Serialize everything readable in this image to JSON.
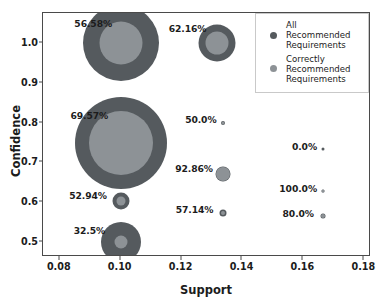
{
  "chart_data": {
    "type": "scatter",
    "title": "",
    "xlabel": "Support",
    "ylabel": "Confidence",
    "xlim": [
      0.0745,
      0.1822
    ],
    "ylim": [
      0.462,
      1.0765
    ],
    "xticks": [
      "0.08",
      "0.10",
      "0.12",
      "0.14",
      "0.16",
      "0.18"
    ],
    "xtick_values": [
      0.08,
      0.1,
      0.12,
      0.14,
      0.16,
      0.18
    ],
    "yticks": [
      "0.5",
      "0.6",
      "0.7",
      "0.8",
      "0.9",
      "1.0"
    ],
    "ytick_values": [
      0.5,
      0.6,
      0.7,
      0.8,
      0.9,
      1.0
    ],
    "grid": false,
    "legend_position": "upper right",
    "series": [
      {
        "name": "All Recommended Requirements",
        "color": "#555a5e",
        "marker": "circle"
      },
      {
        "name": "Correctly Recommended Requirements",
        "color": "#8d9296",
        "marker": "circle"
      }
    ],
    "points": [
      {
        "label": "56.58%",
        "support": 0.1,
        "confidence": 1.0,
        "all_size": 76,
        "correct_size": 43,
        "label_anchor_x": 0.0975,
        "label_anchor_y": 1.049
      },
      {
        "label": "62.16%",
        "support": 0.1315,
        "confidence": 1.0,
        "all_size": 37,
        "correct_size": 23,
        "label_anchor_x": 0.1285,
        "label_anchor_y": 1.036
      },
      {
        "label": "69.57%",
        "support": 0.1,
        "confidence": 0.75,
        "all_size": 92,
        "correct_size": 64,
        "label_anchor_x": 0.0962,
        "label_anchor_y": 0.818
      },
      {
        "label": "50.0%",
        "support": 0.1335,
        "confidence": 0.8,
        "all_size": 4,
        "correct_size": 3,
        "label_anchor_x": 0.1318,
        "label_anchor_y": 0.806
      },
      {
        "label": "0.0%",
        "support": 0.1665,
        "confidence": 0.735,
        "all_size": 3,
        "correct_size": 0,
        "label_anchor_x": 0.1648,
        "label_anchor_y": 0.739
      },
      {
        "label": "92.86%",
        "support": 0.1335,
        "confidence": 0.672,
        "all_size": 15,
        "correct_size": 14,
        "label_anchor_x": 0.1306,
        "label_anchor_y": 0.684
      },
      {
        "label": "100.0%",
        "support": 0.1665,
        "confidence": 0.628,
        "all_size": 3,
        "correct_size": 3,
        "label_anchor_x": 0.1648,
        "label_anchor_y": 0.632
      },
      {
        "label": "52.94%",
        "support": 0.1,
        "confidence": 0.602,
        "all_size": 17,
        "correct_size": 9,
        "label_anchor_x": 0.0958,
        "label_anchor_y": 0.615
      },
      {
        "label": "57.14%",
        "support": 0.1335,
        "confidence": 0.572,
        "all_size": 7,
        "correct_size": 4,
        "label_anchor_x": 0.1308,
        "label_anchor_y": 0.581
      },
      {
        "label": "80.0%",
        "support": 0.1665,
        "confidence": 0.565,
        "all_size": 5,
        "correct_size": 4,
        "label_anchor_x": 0.1638,
        "label_anchor_y": 0.571
      },
      {
        "label": "32.5%",
        "support": 0.1,
        "confidence": 0.5,
        "all_size": 40,
        "correct_size": 13,
        "label_anchor_x": 0.0952,
        "label_anchor_y": 0.528
      }
    ]
  },
  "legend": {
    "entries": [
      {
        "label_line1": "All",
        "label_line2": "Recommended",
        "label_line3": "Requirements",
        "color": "#555a5e"
      },
      {
        "label_line1": "Correctly",
        "label_line2": "Recommended",
        "label_line3": "Requirements",
        "color": "#8d9296"
      }
    ]
  }
}
